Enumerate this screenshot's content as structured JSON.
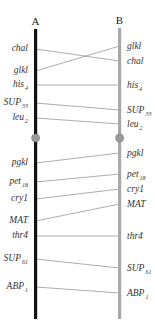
{
  "chromosomes": {
    "A": {
      "label": "A",
      "color": "#111111"
    },
    "B": {
      "label": "B",
      "color": "#a8a8a8"
    }
  },
  "centromere_color": "#9a9a9a",
  "link_color": "#8a8a8a",
  "genes": [
    {
      "id": "chal",
      "base": "chal",
      "sub": "",
      "a_pos": 49,
      "b_pos": 61
    },
    {
      "id": "glkl",
      "base": "glkl",
      "sub": "",
      "a_pos": 71,
      "b_pos": 46
    },
    {
      "id": "his4",
      "base": "his",
      "sub": "4",
      "a_pos": 85,
      "b_pos": 85
    },
    {
      "id": "SUP33",
      "base": "SUP",
      "sub": "33",
      "a_pos": 103,
      "b_pos": 110
    },
    {
      "id": "leu2",
      "base": "leu",
      "sub": "2",
      "a_pos": 118,
      "b_pos": 124
    },
    {
      "id": "pgkl",
      "base": "pgkl",
      "sub": "",
      "a_pos": 163,
      "b_pos": 153
    },
    {
      "id": "pet18",
      "base": "pet",
      "sub": "18",
      "a_pos": 182,
      "b_pos": 174
    },
    {
      "id": "cry1",
      "base": "cry1",
      "sub": "",
      "a_pos": 199,
      "b_pos": 189
    },
    {
      "id": "MAT",
      "base": "MAT",
      "sub": "",
      "a_pos": 221,
      "b_pos": 204
    },
    {
      "id": "thr4",
      "base": "thr4",
      "sub": "",
      "a_pos": 236,
      "b_pos": 236
    },
    {
      "id": "SUP61",
      "base": "SUP",
      "sub": "61",
      "a_pos": 259,
      "b_pos": 268
    },
    {
      "id": "ABP1",
      "base": "ABP",
      "sub": "1",
      "a_pos": 287,
      "b_pos": 293
    }
  ],
  "centromere_pos": 138
}
